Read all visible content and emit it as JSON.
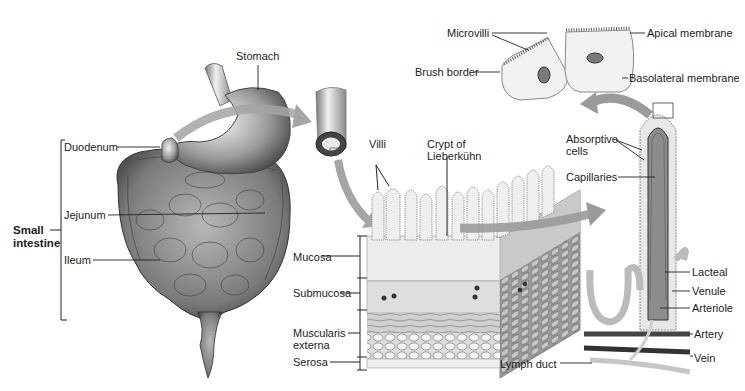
{
  "diagram": {
    "panels": [
      {
        "id": "digestive-organs",
        "labels": [
          "Stomach",
          "Duodenum",
          "Jejunum",
          "Ileum"
        ],
        "bracket_label": "Small intestine"
      },
      {
        "id": "intestine-tube"
      },
      {
        "id": "wall-section",
        "labels": [
          "Villi",
          "Crypt of Lieberkuhn",
          "Mucosa",
          "Submucosa",
          "Muscularis externa",
          "Serosa"
        ]
      },
      {
        "id": "villus",
        "labels": [
          "Absorptive cells",
          "Capillaries",
          "Lacteal",
          "Venule",
          "Arteriole",
          "Artery",
          "Vein",
          "Lymph duct"
        ]
      },
      {
        "id": "epithelial-cells",
        "labels": [
          "Microvilli",
          "Apical membrane",
          "Brush border",
          "Basolateral membrane"
        ]
      }
    ]
  },
  "labels": {
    "stomach": "Stomach",
    "duodenum": "Duodenum",
    "small_intestine_1": "Small",
    "small_intestine_2": "intestine",
    "jejunum": "Jejunum",
    "ileum": "Ileum",
    "villi": "Villi",
    "crypt_1": "Crypt of",
    "crypt_2": "Lieberkühn",
    "mucosa": "Mucosa",
    "submucosa": "Submucosa",
    "muscularis_1": "Muscularis",
    "muscularis_2": "externa",
    "serosa": "Serosa",
    "lymph_duct": "Lymph duct",
    "microvilli": "Microvilli",
    "apical": "Apical membrane",
    "brush_border": "Brush border",
    "basolateral": "Basolateral membrane",
    "absorptive_1": "Absorptive",
    "absorptive_2": "cells",
    "capillaries": "Capillaries",
    "lacteal": "Lacteal",
    "venule": "Venule",
    "arteriole": "Arteriole",
    "artery": "Artery",
    "vein": "Vein"
  },
  "colors": {
    "tissue_light": "#e6e6e6",
    "tissue_mid": "#a8a8a8",
    "tissue_dark": "#5a5a5a",
    "arrow": "#9a9a9a",
    "line": "#222222"
  }
}
